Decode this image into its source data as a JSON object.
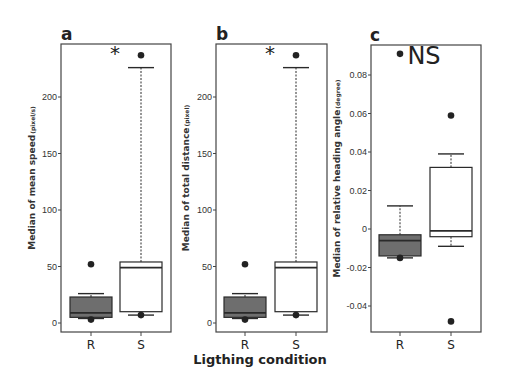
{
  "figure": {
    "xlabel": "Ligthing condition",
    "colors": {
      "R_fill": "#6e6e6e",
      "S_fill": "#ffffff",
      "stroke": "#2a2a2a"
    }
  },
  "chart_data": [
    {
      "type": "box",
      "panel": "a",
      "title": "a",
      "ylabel": "Median of mean speed",
      "ylabel_unit": "(pixel/s)",
      "xlabel": "Ligthing condition",
      "categories": [
        "R",
        "S"
      ],
      "yticks": [
        0,
        50,
        100,
        150,
        200
      ],
      "ylim": [
        -8,
        247
      ],
      "significance": "*",
      "boxes": [
        {
          "name": "R",
          "whisker_low": 4,
          "q1": 5,
          "median": 9,
          "q3": 23,
          "whisker_high": 26,
          "outliers": [
            52,
            3
          ]
        },
        {
          "name": "S",
          "whisker_low": 7,
          "q1": 10,
          "median": 49,
          "q3": 54,
          "whisker_high": 226,
          "outliers": [
            237,
            7
          ]
        }
      ]
    },
    {
      "type": "box",
      "panel": "b",
      "title": "b",
      "ylabel": "Median of total distance",
      "ylabel_unit": "(pixel)",
      "xlabel": "Ligthing condition",
      "categories": [
        "R",
        "S"
      ],
      "yticks": [
        0,
        50,
        100,
        150,
        200
      ],
      "ylim": [
        -8,
        247
      ],
      "significance": "*",
      "boxes": [
        {
          "name": "R",
          "whisker_low": 4,
          "q1": 5,
          "median": 9,
          "q3": 23,
          "whisker_high": 26,
          "outliers": [
            52,
            3
          ]
        },
        {
          "name": "S",
          "whisker_low": 7,
          "q1": 10,
          "median": 49,
          "q3": 54,
          "whisker_high": 226,
          "outliers": [
            237,
            7
          ]
        }
      ]
    },
    {
      "type": "box",
      "panel": "c",
      "title": "c",
      "ylabel": "Median of relative heading angle",
      "ylabel_unit": "(degree)",
      "xlabel": "Ligthing condition",
      "categories": [
        "R",
        "S"
      ],
      "yticks": [
        -0.04,
        -0.02,
        0,
        0.02,
        0.04,
        0.06,
        0.08
      ],
      "ytick_labels": [
        "-0.04",
        "-0.02",
        "0",
        "0.02",
        "0.04",
        "0.06",
        "0.08"
      ],
      "ylim": [
        -0.054,
        0.096
      ],
      "significance": "NS",
      "boxes": [
        {
          "name": "R",
          "whisker_low": -0.015,
          "q1": -0.014,
          "median": -0.006,
          "q3": -0.003,
          "whisker_high": 0.012,
          "outliers": [
            0.091,
            -0.015
          ]
        },
        {
          "name": "S",
          "whisker_low": -0.009,
          "q1": -0.004,
          "median": -0.001,
          "q3": 0.032,
          "whisker_high": 0.039,
          "outliers": [
            0.059,
            -0.048
          ]
        }
      ]
    }
  ]
}
